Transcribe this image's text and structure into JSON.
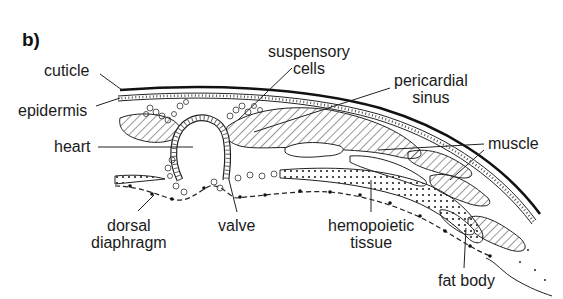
{
  "figure": {
    "panel_label": "b)"
  },
  "labels": {
    "cuticle": "cuticle",
    "epidermis": "epidermis",
    "heart": "heart",
    "suspensory_cells_1": "suspensory",
    "suspensory_cells_2": "cells",
    "pericardial_sinus_1": "pericardial",
    "pericardial_sinus_2": "sinus",
    "muscle": "muscle",
    "dorsal_diaphragm_1": "dorsal",
    "dorsal_diaphragm_2": "diaphragm",
    "valve": "valve",
    "hemopoietic_tissue_1": "hemopoietic",
    "hemopoietic_tissue_2": "tissue",
    "fat_body": "fat body"
  },
  "colors": {
    "ink": "#1a1a1a",
    "background": "#ffffff"
  }
}
